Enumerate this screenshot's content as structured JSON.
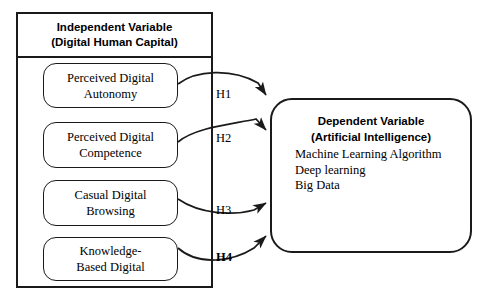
{
  "diagram": {
    "independent_variable": {
      "header": {
        "line1": "Independent Variable",
        "line2": "(Digital Human Capital)"
      },
      "constructs": [
        {
          "line1": "Perceived Digital",
          "line2": "Autonomy"
        },
        {
          "line1": "Perceived Digital",
          "line2": "Competence"
        },
        {
          "line1": "Casual Digital",
          "line2": "Browsing"
        },
        {
          "line1": "Knowledge-",
          "line2": "Based Digital"
        }
      ]
    },
    "dependent_variable": {
      "title_line1": "Dependent Variable",
      "title_line2": "(Artificial Intelligence)",
      "items": [
        "Machine Learning Algorithm",
        "Deep learning",
        "Big Data"
      ]
    },
    "hypotheses": [
      {
        "label": "H1",
        "bold": false
      },
      {
        "label": "H2",
        "bold": false
      },
      {
        "label": "H3",
        "bold": false
      },
      {
        "label": "H4",
        "bold": true
      }
    ],
    "colors": {
      "stroke": "#1a1a1a",
      "background": "#ffffff",
      "text": "#000000"
    }
  }
}
